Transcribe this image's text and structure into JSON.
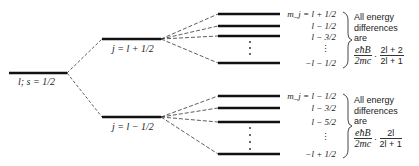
{
  "diagram": {
    "base_level": {
      "label": "l; s = 1/2"
    },
    "j_levels": [
      {
        "label": "j = l + 1/2"
      },
      {
        "label": "j = l − 1/2"
      }
    ],
    "upper_group": {
      "mj_labels": [
        "m_j = l + 1/2",
        "l − 1/2",
        "l − 3/2",
        "⋮",
        "−l − 1/2"
      ],
      "note": {
        "line1": "All energy",
        "line2": "differences",
        "line3": "are",
        "frac1_num": "eħB",
        "frac1_den": "2mc",
        "times": "·",
        "frac2_num": "2l + 2",
        "frac2_den": "2l + 1"
      }
    },
    "lower_group": {
      "mj_labels": [
        "m_j = l − 1/2",
        "l − 3/2",
        "l − 5/2",
        "⋮",
        "−l + 1/2"
      ],
      "note": {
        "line1": "All energy",
        "line2": "differences",
        "line3": "are",
        "frac1_num": "eħB",
        "frac1_den": "2mc",
        "times": "·",
        "frac2_num": "2l",
        "frac2_den": "2l + 1"
      }
    }
  }
}
